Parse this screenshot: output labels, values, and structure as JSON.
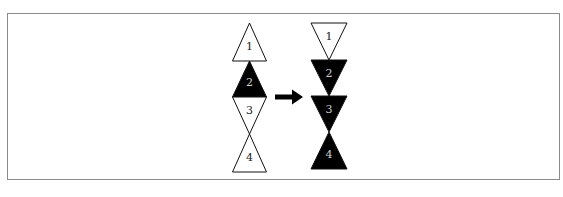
{
  "diagram": {
    "colors": {
      "filled": "#000000",
      "empty": "#ffffff",
      "stroke": "#111111",
      "label_on_empty": "#222222",
      "label_on_filled": "#cfcfcf",
      "arrow": "#000000",
      "frame": "#8a8a8a"
    },
    "before": {
      "name": "before-stack",
      "triangles": [
        {
          "label": "1",
          "orientation": "up",
          "filled": false
        },
        {
          "label": "2",
          "orientation": "up",
          "filled": true
        },
        {
          "label": "3",
          "orientation": "down",
          "filled": false
        },
        {
          "label": "4",
          "orientation": "up",
          "filled": false
        }
      ]
    },
    "arrow": {
      "direction": "right"
    },
    "after": {
      "name": "after-stack",
      "triangles": [
        {
          "label": "1",
          "orientation": "down",
          "filled": false
        },
        {
          "label": "2",
          "orientation": "down",
          "filled": true
        },
        {
          "label": "3",
          "orientation": "down",
          "filled": true
        },
        {
          "label": "4",
          "orientation": "up",
          "filled": true
        }
      ]
    }
  }
}
